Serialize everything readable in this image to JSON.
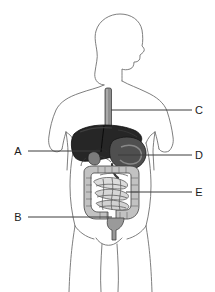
{
  "figure": {
    "name": "human-digestive-system-labeled-diagram",
    "background_color": "#ffffff",
    "width": 215,
    "height": 292,
    "body_outline_color": "#6b6b6b",
    "label_text_color": "#1a1a1a",
    "leader_line_color": "#3d3d3d"
  },
  "body_figure": {
    "description": "silhouette-outline-of-human-torso-head-profile-arms-and-legs",
    "head_orientation": "profile-facing-right"
  },
  "organs": [
    {
      "id": "esophagus",
      "name": "esophagus",
      "fill": "#8f8f8f",
      "stroke": "#4a4a4a"
    },
    {
      "id": "liver",
      "name": "liver",
      "fill": "#262626",
      "stroke": "#111111"
    },
    {
      "id": "gallbladder",
      "name": "gallbladder",
      "fill": "#6d6d6d",
      "stroke": "#1c1c1c"
    },
    {
      "id": "stomach",
      "name": "stomach",
      "fill": "#4f4f4f",
      "stroke": "#1c1c1c"
    },
    {
      "id": "large-intestine",
      "name": "large-intestine",
      "fill": "#c4c4c4",
      "stroke": "#4a4a4a"
    },
    {
      "id": "small-intestine",
      "name": "small-intestine",
      "fill": "#d6d6d6",
      "stroke": "#5a5a5a"
    },
    {
      "id": "rectum",
      "name": "rectum",
      "fill": "#9a9a9a",
      "stroke": "#4a4a4a"
    }
  ],
  "labels": [
    {
      "id": "A",
      "text": "A",
      "side": "left",
      "text_x": 18,
      "text_y": 155,
      "line_x1": 28,
      "line_x2": 100,
      "line_y": 151
    },
    {
      "id": "B",
      "text": "B",
      "side": "left",
      "text_x": 18,
      "text_y": 221,
      "line_x1": 28,
      "line_x2": 112,
      "line_y": 217
    },
    {
      "id": "C",
      "text": "C",
      "side": "right",
      "text_x": 196,
      "text_y": 114,
      "line_x1": 111,
      "line_x2": 192,
      "line_y": 110
    },
    {
      "id": "D",
      "text": "D",
      "side": "right",
      "text_x": 196,
      "text_y": 159,
      "line_x1": 118,
      "line_x2": 192,
      "line_y": 155
    },
    {
      "id": "E",
      "text": "E",
      "side": "right",
      "text_x": 196,
      "text_y": 196,
      "line_x1": 126,
      "line_x2": 192,
      "line_y": 192
    }
  ]
}
